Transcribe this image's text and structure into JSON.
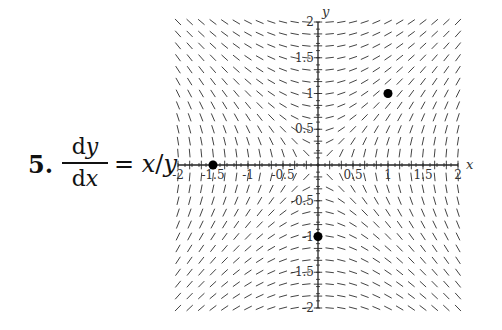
{
  "problem": {
    "number": "5.",
    "numerator_d": "d",
    "numerator_var": "y",
    "denominator_d": "d",
    "denominator_var": "x",
    "equals": "=",
    "rhs_x": "x",
    "rhs_slash": "/",
    "rhs_y": "y"
  },
  "chart_data": {
    "type": "slope_field",
    "equation": "dy/dx = x/y",
    "xlabel": "x",
    "ylabel": "y",
    "xlim": [
      -2,
      2
    ],
    "ylim": [
      -2,
      2
    ],
    "x_ticks": [
      -2,
      -1.5,
      -1,
      -0.5,
      0.5,
      1,
      1.5,
      2
    ],
    "x_tick_labels": [
      "-2",
      "-1.5",
      "-1",
      "-0.5",
      "0.5",
      "1",
      "1.5",
      "2"
    ],
    "y_ticks": [
      2,
      1.5,
      1,
      0.5,
      -0.5,
      -1,
      -1.5,
      -2
    ],
    "y_tick_labels": [
      "2",
      "1.5",
      "1",
      "0.5",
      "-0.5",
      "-1",
      "-1.5",
      "-2"
    ],
    "grid_points": 25,
    "points": [
      {
        "x": 1,
        "y": 1
      },
      {
        "x": -1.5,
        "y": 0
      },
      {
        "x": 0,
        "y": -1
      }
    ],
    "pixel_frame": {
      "origin_x": 318,
      "origin_y": 165,
      "px_per_unit_x": 70,
      "px_per_unit_y": 71.5
    },
    "colors": {
      "segment": "#444444",
      "axis": "#222222",
      "point": "#000000"
    }
  }
}
